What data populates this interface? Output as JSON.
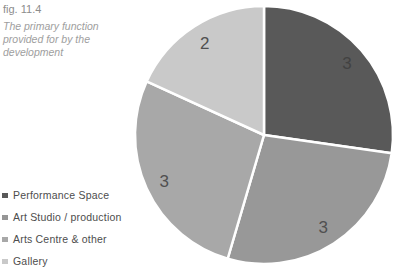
{
  "figure": {
    "label": "fig. 11.4",
    "caption": "The primary function provided for by the development"
  },
  "legend": {
    "items": [
      {
        "label": "Performance Space",
        "color": "#595959"
      },
      {
        "label": "Art Studio / production",
        "color": "#969696"
      },
      {
        "label": "Arts Centre & other",
        "color": "#a8a8a8"
      },
      {
        "label": "Gallery",
        "color": "#c9c9c9"
      }
    ]
  },
  "chart_data": {
    "type": "pie",
    "title": "fig. 11.4",
    "subtitle": "The primary function provided for by the development",
    "categories": [
      "Performance Space",
      "Art Studio / production",
      "Arts Centre & other",
      "Gallery"
    ],
    "values": [
      3,
      3,
      3,
      2
    ],
    "data_labels": [
      "3",
      "3",
      "3",
      "2"
    ],
    "slice_colors": [
      "#595959",
      "#989898",
      "#a8a8a8",
      "#c9c9c9"
    ],
    "label_colors": [
      "#424242",
      "#505050",
      "#505050",
      "#505050"
    ],
    "start_angle_deg": 0,
    "direction": "clockwise",
    "separator_color": "#ffffff",
    "legend_position": "bottom-left"
  }
}
